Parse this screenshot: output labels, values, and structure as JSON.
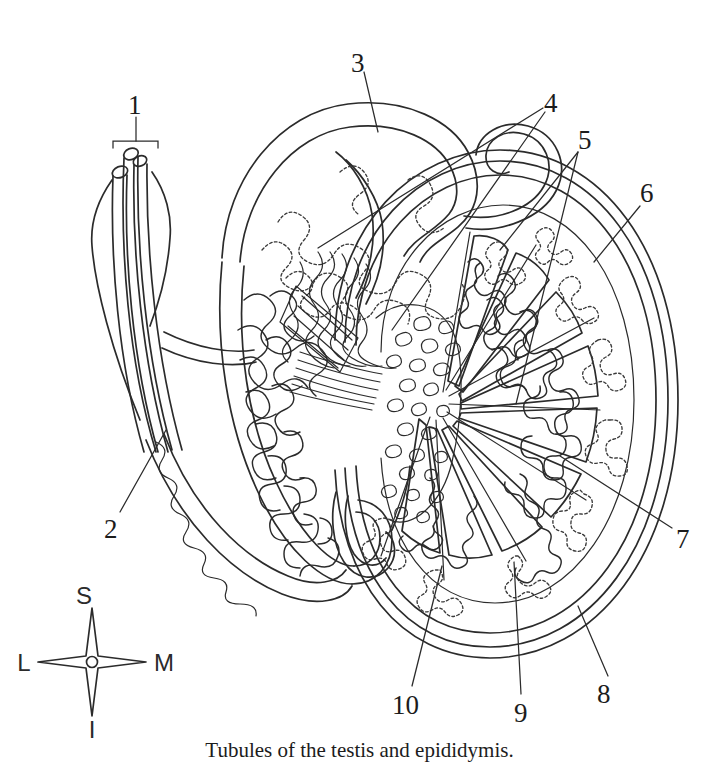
{
  "figure": {
    "title": "Tubules of the testis and epididymis",
    "type": "anatomical-line-diagram",
    "line_color": "#2b2b2b",
    "background_color": "#ffffff"
  },
  "caption": {
    "text": "Tubules of the testis and epididymis."
  },
  "labels": [
    {
      "id": "1",
      "text": "1",
      "x": 136,
      "y": 105,
      "bracket": true
    },
    {
      "id": "2",
      "text": "2",
      "x": 112,
      "y": 529
    },
    {
      "id": "3",
      "text": "3",
      "x": 358,
      "y": 63
    },
    {
      "id": "4",
      "text": "4",
      "x": 551,
      "y": 103
    },
    {
      "id": "5",
      "text": "5",
      "x": 585,
      "y": 140
    },
    {
      "id": "6",
      "text": "6",
      "x": 647,
      "y": 193
    },
    {
      "id": "7",
      "text": "7",
      "x": 683,
      "y": 539
    },
    {
      "id": "8",
      "text": "8",
      "x": 604,
      "y": 694
    },
    {
      "id": "9",
      "text": "9",
      "x": 521,
      "y": 713
    },
    {
      "id": "10",
      "text": "10",
      "x": 399,
      "y": 705
    }
  ],
  "compass": {
    "center_x": 92,
    "center_y": 662,
    "superior": "S",
    "inferior": "I",
    "lateral": "L",
    "medial": "M"
  }
}
